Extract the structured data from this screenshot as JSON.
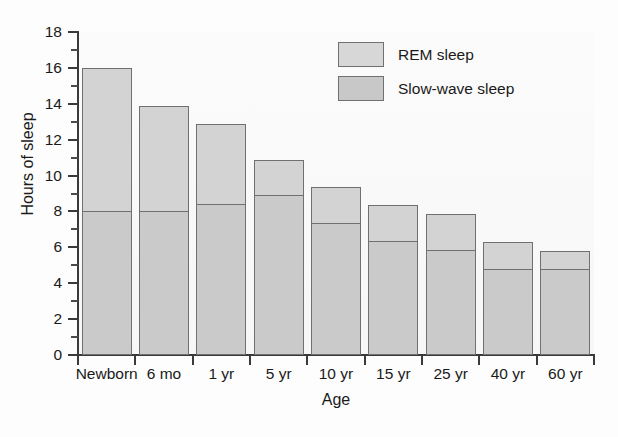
{
  "chart_data": {
    "type": "bar",
    "title": "",
    "xlabel": "Age",
    "ylabel": "Hours of sleep",
    "ylim": [
      0,
      18
    ],
    "ytick_step": 2,
    "yticks": [
      0,
      2,
      4,
      6,
      8,
      10,
      12,
      14,
      16,
      18
    ],
    "ytick_labels": [
      "0",
      "2",
      "4",
      "6",
      "8",
      "10",
      "12",
      "14",
      "16",
      "18"
    ],
    "yminor_ticks": [
      1,
      3,
      5,
      7,
      9,
      11,
      13,
      15,
      17
    ],
    "grid": false,
    "stacked": true,
    "legend_position": "top-right",
    "categories": [
      "Newborn",
      "6 mo",
      "1 yr",
      "5 yr",
      "10 yr",
      "15 yr",
      "25 yr",
      "40 yr",
      "60 yr"
    ],
    "series": [
      {
        "name": "Slow-wave sleep",
        "color": "#cacaca",
        "values": [
          8.0,
          8.0,
          8.4,
          8.9,
          7.35,
          6.35,
          5.85,
          4.8,
          4.8
        ]
      },
      {
        "name": "REM sleep",
        "color": "#d3d3d3",
        "values": [
          8.0,
          5.9,
          4.5,
          1.95,
          2.0,
          2.0,
          2.0,
          1.5,
          1.0
        ]
      }
    ],
    "totals": [
      16.0,
      13.9,
      12.9,
      10.85,
      9.35,
      8.35,
      7.85,
      6.3,
      5.8
    ]
  },
  "legend": {
    "items": [
      {
        "label": "REM sleep",
        "swatch": "rem"
      },
      {
        "label": "Slow-wave sleep",
        "swatch": "sws"
      }
    ]
  },
  "caption": {
    "remnant": ""
  }
}
